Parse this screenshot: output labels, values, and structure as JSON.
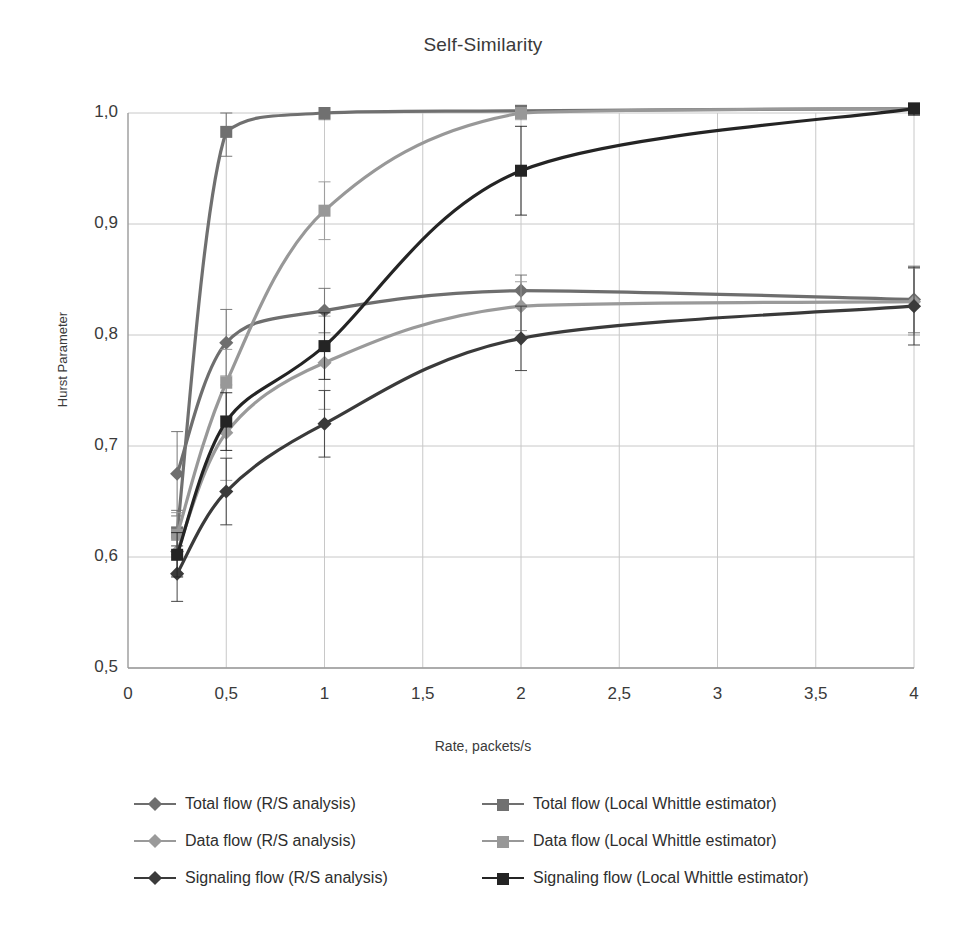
{
  "chart_data": {
    "type": "line",
    "title": "Self-Similarity",
    "xlabel": "Rate, packets/s",
    "ylabel": "Hurst Parameter",
    "xlim": [
      0,
      4
    ],
    "ylim": [
      0.5,
      1.0
    ],
    "grid": true,
    "legend_position": "bottom",
    "x_tick_labels": [
      "0",
      "0,5",
      "1",
      "1,5",
      "2",
      "2,5",
      "3",
      "3,5",
      "4"
    ],
    "x_tick_values": [
      0,
      0.5,
      1,
      1.5,
      2,
      2.5,
      3,
      3.5,
      4
    ],
    "y_tick_labels": [
      "0,5",
      "0,6",
      "0,7",
      "0,8",
      "0,9",
      "1,0"
    ],
    "y_tick_values": [
      0.5,
      0.6,
      0.7,
      0.8,
      0.9,
      1.0
    ],
    "x": [
      0.25,
      0.5,
      1,
      2,
      4
    ],
    "series": [
      {
        "name": "Total flow (R/S analysis)",
        "marker": "diamond",
        "color": "#6e6e6e",
        "values": [
          0.675,
          0.793,
          0.822,
          0.84,
          0.832
        ],
        "errors": [
          0.038,
          0.03,
          0.02,
          0.014,
          0.03
        ]
      },
      {
        "name": "Data flow (R/S analysis)",
        "marker": "diamond",
        "color": "#9a9a9a",
        "values": [
          0.605,
          0.712,
          0.775,
          0.826,
          0.83
        ],
        "errors": [
          0.022,
          0.043,
          0.042,
          0.022,
          0.03
        ]
      },
      {
        "name": "Signaling flow (R/S analysis)",
        "marker": "diamond",
        "color": "#3a3a3a",
        "values": [
          0.585,
          0.659,
          0.72,
          0.797,
          0.826
        ],
        "errors": [
          0.025,
          0.03,
          0.03,
          0.029,
          0.035
        ]
      },
      {
        "name": "Total flow (Local Whittle estimator)",
        "marker": "square",
        "color": "#707070",
        "values": [
          0.622,
          0.983,
          1.0,
          1.002,
          1.004
        ],
        "errors": [
          0.02,
          0.022,
          0.006,
          0.004,
          0.004
        ]
      },
      {
        "name": "Data flow (Local Whittle estimator)",
        "marker": "square",
        "color": "#989898",
        "values": [
          0.62,
          0.757,
          0.912,
          1.0,
          1.004
        ],
        "errors": [
          0.02,
          0.03,
          0.026,
          0.006,
          0.004
        ]
      },
      {
        "name": "Signaling flow (Local Whittle estimator)",
        "marker": "square",
        "color": "#242424",
        "values": [
          0.602,
          0.722,
          0.79,
          0.948,
          1.004
        ],
        "errors": [
          0.02,
          0.026,
          0.03,
          0.04,
          0.006
        ]
      }
    ]
  },
  "legend": {
    "items": [
      {
        "label": "Total flow (R/S analysis)",
        "marker": "diamond",
        "color": "#6e6e6e"
      },
      {
        "label": "Total flow (Local Whittle estimator)",
        "marker": "square",
        "color": "#707070"
      },
      {
        "label": "Data flow (R/S analysis)",
        "marker": "diamond",
        "color": "#9a9a9a"
      },
      {
        "label": "Data flow (Local Whittle estimator)",
        "marker": "square",
        "color": "#989898"
      },
      {
        "label": "Signaling flow (R/S analysis)",
        "marker": "diamond",
        "color": "#3a3a3a"
      },
      {
        "label": "Signaling flow (Local Whittle estimator)",
        "marker": "square",
        "color": "#242424"
      }
    ]
  },
  "style": {
    "axis_color": "#9a9a9a",
    "grid_color": "#c8c8c8",
    "text_color": "#3a3a3a",
    "background": "#ffffff"
  }
}
